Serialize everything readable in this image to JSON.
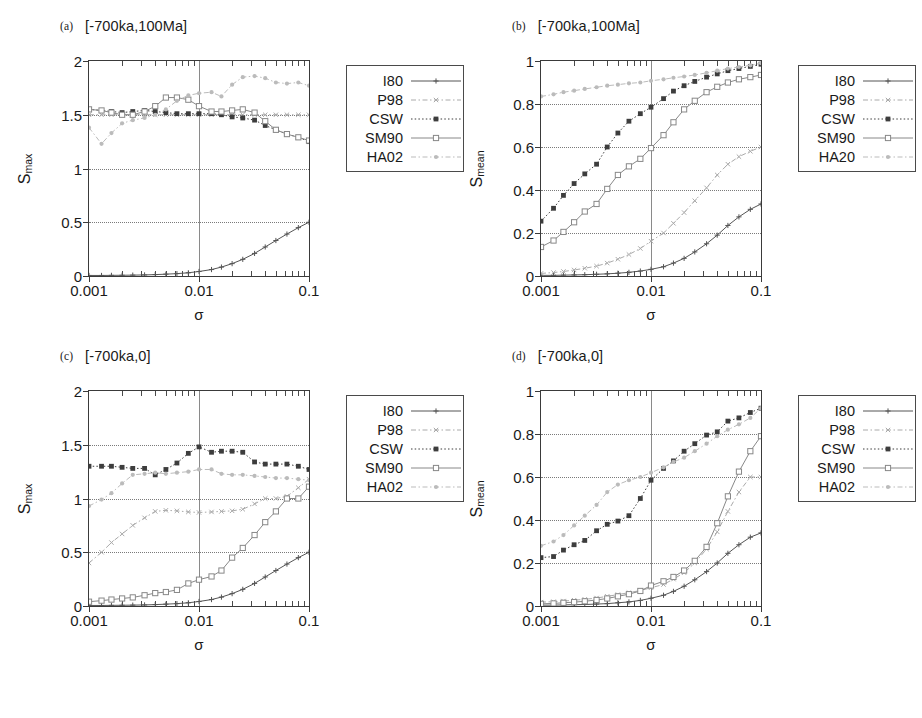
{
  "figure": {
    "background": "#ffffff",
    "axis_color": "#3a3a3a"
  },
  "series_style": {
    "I80": {
      "color": "#555555",
      "dash": "none",
      "marker": "plus",
      "label": "I80"
    },
    "P98": {
      "color": "#aaaaaa",
      "dash": "dashdot",
      "marker": "cross",
      "label": "P98"
    },
    "CSW": {
      "color": "#3d3d3d",
      "dash": "dotted",
      "marker": "sq-fill",
      "label": "CSW"
    },
    "SM90": {
      "color": "#888888",
      "dash": "none",
      "marker": "sq-open",
      "label": "SM90"
    },
    "HA02": {
      "color": "#bbbbbb",
      "dash": "dashdot",
      "marker": "dot",
      "label": "HA02"
    }
  },
  "axis_titles": {
    "x": "σ",
    "y_max": "S",
    "y_max_sub": "max",
    "y_mean": "S",
    "y_mean_sub": "mean"
  },
  "xticks": {
    "labels": [
      "0.001",
      "0.01",
      "0.1"
    ],
    "values": [
      0.001,
      0.01,
      0.1
    ]
  },
  "yticks_max": {
    "labels": [
      "0",
      "0.5",
      "1",
      "1.5",
      "2"
    ],
    "values": [
      0,
      0.5,
      1,
      1.5,
      2
    ]
  },
  "yticks_mean": {
    "labels": [
      "0",
      "0.2",
      "0.4",
      "0.6",
      "0.8",
      "1"
    ],
    "values": [
      0,
      0.2,
      0.4,
      0.6,
      0.8,
      1
    ]
  },
  "panels": {
    "a": {
      "tag": "(a)",
      "title": "[-700ka,100Ma]",
      "legend": [
        "I80",
        "P98",
        "CSW",
        "SM90",
        "HA02"
      ]
    },
    "b": {
      "tag": "(b)",
      "title": "[-700ka,100Ma]",
      "legend": [
        "I80",
        "P98",
        "CSW",
        "SM90",
        "HA20"
      ]
    },
    "c": {
      "tag": "(c)",
      "title": "[-700ka,0]",
      "legend": [
        "I80",
        "P98",
        "CSW",
        "SM90",
        "HA02"
      ]
    },
    "d": {
      "tag": "(d)",
      "title": "[-700ka,0]",
      "legend": [
        "I80",
        "P98",
        "CSW",
        "SM90",
        "HA02"
      ]
    }
  },
  "chart_data": [
    {
      "type": "line",
      "panel": "a",
      "title": "(a) [-700ka,100Ma]",
      "xlabel": "σ",
      "ylabel": "S_max",
      "xscale": "log",
      "xlim": [
        0.001,
        0.1
      ],
      "ylim": [
        0,
        2
      ],
      "grid": true,
      "legend_position": "right-outside",
      "x": [
        0.001,
        0.0013,
        0.0016,
        0.002,
        0.0025,
        0.0032,
        0.004,
        0.005,
        0.0063,
        0.008,
        0.01,
        0.013,
        0.016,
        0.02,
        0.025,
        0.032,
        0.04,
        0.05,
        0.063,
        0.08,
        0.1
      ],
      "series": [
        {
          "name": "I80",
          "values": [
            0.005,
            0.005,
            0.006,
            0.007,
            0.008,
            0.01,
            0.013,
            0.017,
            0.022,
            0.03,
            0.042,
            0.06,
            0.083,
            0.115,
            0.155,
            0.21,
            0.27,
            0.33,
            0.39,
            0.45,
            0.5
          ]
        },
        {
          "name": "P98",
          "values": [
            1.5,
            1.5,
            1.5,
            1.5,
            1.5,
            1.5,
            1.5,
            1.5,
            1.5,
            1.5,
            1.5,
            1.5,
            1.5,
            1.5,
            1.5,
            1.5,
            1.5,
            1.5,
            1.5,
            1.5,
            1.5
          ]
        },
        {
          "name": "CSW",
          "values": [
            1.55,
            1.54,
            1.53,
            1.52,
            1.53,
            1.54,
            1.53,
            1.52,
            1.51,
            1.51,
            1.51,
            1.51,
            1.5,
            1.48,
            1.47,
            1.45,
            1.4,
            1.36,
            1.32,
            1.29,
            1.25
          ]
        },
        {
          "name": "SM90",
          "values": [
            1.55,
            1.54,
            1.52,
            1.5,
            1.5,
            1.53,
            1.58,
            1.66,
            1.66,
            1.64,
            1.58,
            1.53,
            1.53,
            1.54,
            1.55,
            1.52,
            1.44,
            1.36,
            1.32,
            1.29,
            1.26
          ]
        },
        {
          "name": "HA02",
          "values": [
            1.38,
            1.23,
            1.33,
            1.42,
            1.45,
            1.47,
            1.5,
            1.55,
            1.63,
            1.68,
            1.7,
            1.71,
            1.67,
            1.78,
            1.85,
            1.86,
            1.84,
            1.8,
            1.79,
            1.8,
            1.77
          ]
        }
      ]
    },
    {
      "type": "line",
      "panel": "b",
      "title": "(b) [-700ka,100Ma]",
      "xlabel": "σ",
      "ylabel": "S_mean",
      "xscale": "log",
      "xlim": [
        0.001,
        0.1
      ],
      "ylim": [
        0,
        1
      ],
      "grid": true,
      "legend_position": "right-outside",
      "x": [
        0.001,
        0.0013,
        0.0016,
        0.002,
        0.0025,
        0.0032,
        0.004,
        0.005,
        0.0063,
        0.008,
        0.01,
        0.013,
        0.016,
        0.02,
        0.025,
        0.032,
        0.04,
        0.05,
        0.063,
        0.08,
        0.1
      ],
      "series": [
        {
          "name": "I80",
          "values": [
            0.003,
            0.003,
            0.004,
            0.005,
            0.006,
            0.008,
            0.01,
            0.013,
            0.017,
            0.023,
            0.031,
            0.043,
            0.06,
            0.082,
            0.112,
            0.15,
            0.19,
            0.235,
            0.275,
            0.31,
            0.335
          ]
        },
        {
          "name": "P98",
          "values": [
            0.012,
            0.016,
            0.021,
            0.028,
            0.036,
            0.046,
            0.06,
            0.078,
            0.1,
            0.128,
            0.162,
            0.2,
            0.245,
            0.295,
            0.35,
            0.41,
            0.47,
            0.52,
            0.555,
            0.58,
            0.6
          ]
        },
        {
          "name": "CSW",
          "values": [
            0.255,
            0.315,
            0.375,
            0.43,
            0.475,
            0.52,
            0.6,
            0.665,
            0.72,
            0.755,
            0.785,
            0.825,
            0.86,
            0.885,
            0.905,
            0.925,
            0.94,
            0.955,
            0.965,
            0.975,
            0.985
          ]
        },
        {
          "name": "SM90",
          "values": [
            0.135,
            0.165,
            0.205,
            0.25,
            0.3,
            0.335,
            0.405,
            0.47,
            0.51,
            0.545,
            0.595,
            0.655,
            0.715,
            0.775,
            0.815,
            0.855,
            0.88,
            0.9,
            0.915,
            0.925,
            0.935
          ]
        },
        {
          "name": "HA20",
          "values": [
            0.835,
            0.845,
            0.855,
            0.862,
            0.87,
            0.878,
            0.885,
            0.89,
            0.896,
            0.9,
            0.908,
            0.915,
            0.922,
            0.928,
            0.935,
            0.945,
            0.955,
            0.965,
            0.972,
            0.98,
            0.99
          ]
        }
      ]
    },
    {
      "type": "line",
      "panel": "c",
      "title": "(c) [-700ka,0]",
      "xlabel": "σ",
      "ylabel": "S_max",
      "xscale": "log",
      "xlim": [
        0.001,
        0.1
      ],
      "ylim": [
        0,
        2
      ],
      "grid": true,
      "legend_position": "right-outside",
      "x": [
        0.001,
        0.0013,
        0.0016,
        0.002,
        0.0025,
        0.0032,
        0.004,
        0.005,
        0.0063,
        0.008,
        0.01,
        0.013,
        0.016,
        0.02,
        0.025,
        0.032,
        0.04,
        0.05,
        0.063,
        0.08,
        0.1
      ],
      "series": [
        {
          "name": "I80",
          "values": [
            0.005,
            0.005,
            0.006,
            0.007,
            0.008,
            0.01,
            0.013,
            0.017,
            0.022,
            0.03,
            0.042,
            0.06,
            0.083,
            0.115,
            0.155,
            0.21,
            0.27,
            0.33,
            0.39,
            0.45,
            0.5
          ]
        },
        {
          "name": "P98",
          "values": [
            0.4,
            0.5,
            0.59,
            0.67,
            0.75,
            0.82,
            0.88,
            0.89,
            0.885,
            0.875,
            0.87,
            0.875,
            0.88,
            0.885,
            0.9,
            0.95,
            1.0,
            1.0,
            1.02,
            1.1,
            1.18
          ]
        },
        {
          "name": "CSW",
          "values": [
            1.3,
            1.3,
            1.3,
            1.29,
            1.28,
            1.28,
            1.22,
            1.27,
            1.33,
            1.42,
            1.48,
            1.43,
            1.44,
            1.44,
            1.43,
            1.34,
            1.32,
            1.32,
            1.32,
            1.3,
            1.27
          ]
        },
        {
          "name": "SM90",
          "values": [
            0.04,
            0.05,
            0.06,
            0.07,
            0.08,
            0.1,
            0.12,
            0.13,
            0.15,
            0.21,
            0.245,
            0.275,
            0.33,
            0.45,
            0.54,
            0.66,
            0.78,
            0.88,
            1.0,
            1.0,
            1.11
          ]
        },
        {
          "name": "HA02",
          "values": [
            0.93,
            0.99,
            1.05,
            1.14,
            1.22,
            1.23,
            1.24,
            1.23,
            1.24,
            1.25,
            1.27,
            1.27,
            1.23,
            1.22,
            1.22,
            1.21,
            1.2,
            1.19,
            1.19,
            1.18,
            1.17
          ]
        }
      ]
    },
    {
      "type": "line",
      "panel": "d",
      "title": "(d) [-700ka,0]",
      "xlabel": "σ",
      "ylabel": "S_mean",
      "xscale": "log",
      "xlim": [
        0.001,
        0.1
      ],
      "ylim": [
        0,
        1
      ],
      "grid": true,
      "legend_position": "right-outside",
      "x": [
        0.001,
        0.0013,
        0.0016,
        0.002,
        0.0025,
        0.0032,
        0.004,
        0.005,
        0.0063,
        0.008,
        0.01,
        0.013,
        0.016,
        0.02,
        0.025,
        0.032,
        0.04,
        0.05,
        0.063,
        0.08,
        0.1
      ],
      "series": [
        {
          "name": "I80",
          "values": [
            0.004,
            0.004,
            0.005,
            0.006,
            0.007,
            0.009,
            0.011,
            0.015,
            0.019,
            0.026,
            0.036,
            0.05,
            0.068,
            0.092,
            0.122,
            0.16,
            0.2,
            0.245,
            0.285,
            0.32,
            0.34
          ]
        },
        {
          "name": "P98",
          "values": [
            0.018,
            0.02,
            0.023,
            0.027,
            0.031,
            0.037,
            0.045,
            0.053,
            0.062,
            0.072,
            0.085,
            0.1,
            0.125,
            0.155,
            0.2,
            0.265,
            0.345,
            0.44,
            0.53,
            0.6,
            0.6
          ]
        },
        {
          "name": "CSW",
          "values": [
            0.225,
            0.23,
            0.26,
            0.285,
            0.305,
            0.35,
            0.38,
            0.395,
            0.42,
            0.5,
            0.585,
            0.64,
            0.675,
            0.72,
            0.755,
            0.795,
            0.81,
            0.86,
            0.875,
            0.9,
            0.92
          ]
        },
        {
          "name": "SM90",
          "values": [
            0.01,
            0.012,
            0.015,
            0.018,
            0.022,
            0.028,
            0.035,
            0.045,
            0.055,
            0.07,
            0.095,
            0.115,
            0.135,
            0.165,
            0.21,
            0.275,
            0.385,
            0.51,
            0.625,
            0.72,
            0.79
          ]
        },
        {
          "name": "HA02",
          "values": [
            0.28,
            0.3,
            0.33,
            0.375,
            0.42,
            0.47,
            0.53,
            0.565,
            0.585,
            0.6,
            0.62,
            0.645,
            0.67,
            0.69,
            0.72,
            0.755,
            0.79,
            0.82,
            0.845,
            0.875,
            0.92
          ]
        }
      ]
    }
  ]
}
